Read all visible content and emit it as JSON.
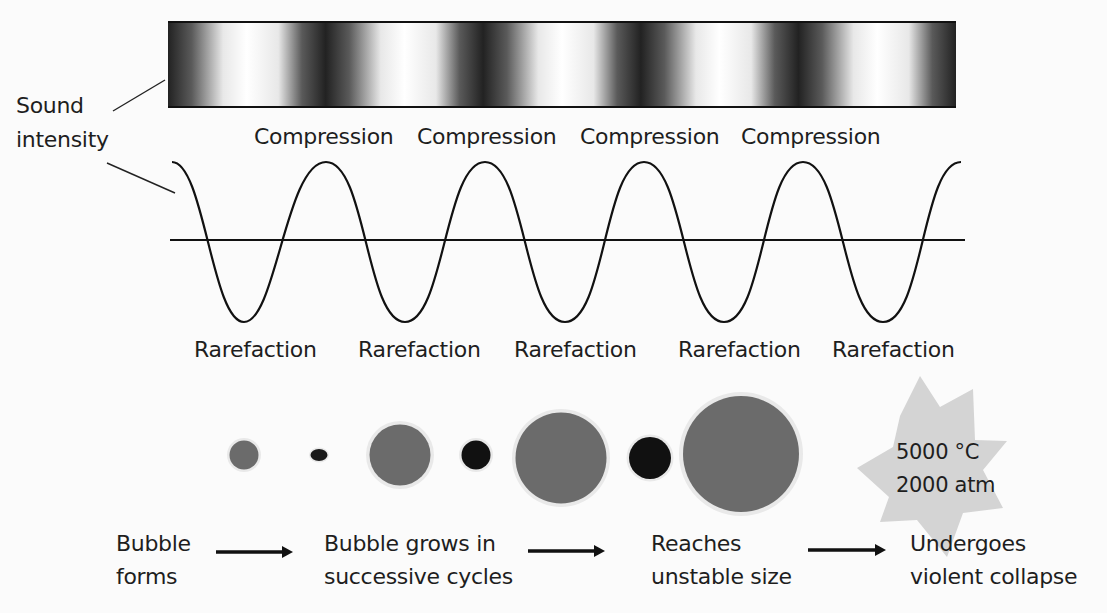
{
  "diagram": {
    "intensity_label": [
      "Sound",
      "intensity"
    ],
    "compression_labels": [
      "Compression",
      "Compression",
      "Compression",
      "Compression"
    ],
    "rarefaction_labels": [
      "Rarefaction",
      "Rarefaction",
      "Rarefaction",
      "Rarefaction",
      "Rarefaction"
    ],
    "collapse_conditions": {
      "temperature": "5000 °C",
      "pressure": "2000 atm"
    },
    "stages": [
      {
        "line1": "Bubble",
        "line2": "forms"
      },
      {
        "line1": "Bubble grows in",
        "line2": "successive cycles"
      },
      {
        "line1": "Reaches",
        "line2": "unstable size"
      },
      {
        "line1": "Undergoes",
        "line2": "violent collapse"
      }
    ],
    "bubbles": [
      {
        "cx": 244,
        "cy": 455,
        "r": 15,
        "color": "#6b6b6b",
        "phase": "rarefaction"
      },
      {
        "cx": 319,
        "cy": 455,
        "r": 8,
        "color": "#1a1a1a",
        "phase": "compression"
      },
      {
        "cx": 400,
        "cy": 455,
        "r": 31,
        "color": "#6b6b6b",
        "phase": "rarefaction"
      },
      {
        "cx": 476,
        "cy": 455,
        "r": 15,
        "color": "#111111",
        "phase": "compression"
      },
      {
        "cx": 561,
        "cy": 458,
        "r": 46,
        "color": "#6b6b6b",
        "phase": "rarefaction"
      },
      {
        "cx": 650,
        "cy": 458,
        "r": 21,
        "color": "#111111",
        "phase": "compression"
      },
      {
        "cx": 741,
        "cy": 454,
        "r": 58,
        "color": "#6b6b6b",
        "phase": "rarefaction"
      }
    ],
    "colors": {
      "background": "#fbfbfb",
      "ink": "#1e1e1e",
      "bubble_gray": "#6b6b6b",
      "bubble_dark": "#111111",
      "halo": "#e6e6e6",
      "star": "#d4d4d4"
    }
  }
}
